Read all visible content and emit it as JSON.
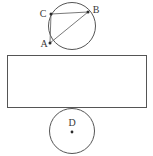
{
  "figure": {
    "background_color": "#ffffff",
    "stroke_color": "#555555",
    "label_color": "#3a3a3a",
    "width": 153,
    "height": 156,
    "labels": {
      "A": "A",
      "B": "B",
      "C": "C",
      "D": "D"
    },
    "shapes": {
      "top_circle": {
        "cx": 72,
        "cy": 26,
        "r": 23.5
      },
      "bottom_circle": {
        "cx": 72,
        "cy": 131,
        "r": 22.5
      },
      "rectangle": {
        "x": 7,
        "y": 55,
        "width": 140,
        "height": 53
      }
    },
    "points": {
      "A": {
        "x": 50,
        "y": 43
      },
      "B": {
        "x": 88,
        "y": 12
      },
      "C": {
        "x": 51,
        "y": 14
      },
      "D": {
        "x": 72,
        "y": 132
      }
    },
    "segments": [
      {
        "name": "chord-c-b",
        "from": "C",
        "to": "B"
      },
      {
        "name": "chord-c-a",
        "from": "C",
        "to": "A"
      },
      {
        "name": "chord-a-b",
        "from": "A",
        "to": "B"
      }
    ],
    "label_positions": {
      "A": {
        "x": 44,
        "y": 47
      },
      "B": {
        "x": 93,
        "y": 13
      },
      "C": {
        "x": 43,
        "y": 17
      },
      "D": {
        "x": 69,
        "y": 126
      }
    }
  }
}
